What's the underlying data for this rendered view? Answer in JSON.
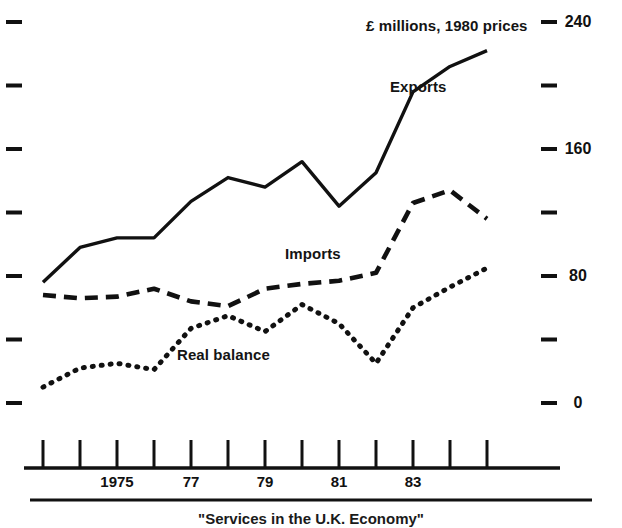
{
  "figure": {
    "units_label": "£ millions, 1980 prices",
    "caption": "\"Services in the U.K. Economy\""
  },
  "series_labels": {
    "exports": "Exports",
    "imports": "Imports",
    "real_balance": "Real balance"
  },
  "y_axis": {
    "labels": [
      "240",
      "160",
      "80",
      "0"
    ],
    "tick_values": [
      240,
      200,
      160,
      120,
      80,
      40,
      0
    ],
    "labeled_values": [
      240,
      160,
      80,
      0
    ],
    "min": 0,
    "max": 240
  },
  "x_axis": {
    "labels": [
      "1975",
      "77",
      "79",
      "81",
      "83"
    ],
    "label_years": [
      1975,
      1977,
      1979,
      1981,
      1983
    ],
    "tick_years": [
      1973,
      1974,
      1975,
      1976,
      1977,
      1978,
      1979,
      1980,
      1981,
      1982,
      1983,
      1984,
      1985
    ],
    "min": 1973,
    "max": 1985
  },
  "chart_data": {
    "type": "line",
    "title": "",
    "subtitle": "",
    "xlabel": "",
    "ylabel": "£ millions, 1980 prices",
    "xlim": [
      1973,
      1985
    ],
    "ylim": [
      0,
      240
    ],
    "grid": false,
    "legend": "inline-annotations",
    "x": [
      1973,
      1974,
      1975,
      1976,
      1977,
      1978,
      1979,
      1980,
      1981,
      1982,
      1983,
      1984,
      1985
    ],
    "series": [
      {
        "name": "Exports",
        "style": "solid",
        "values": [
          76,
          98,
          104,
          104,
          127,
          142,
          136,
          152,
          124,
          145,
          196,
          212,
          222
        ]
      },
      {
        "name": "Imports",
        "style": "dashed",
        "values": [
          68,
          66,
          67,
          72,
          64,
          61,
          72,
          75,
          77,
          82,
          126,
          134,
          116
        ]
      },
      {
        "name": "Real balance",
        "style": "dotted",
        "values": [
          10,
          22,
          25,
          21,
          47,
          55,
          45,
          62,
          50,
          25,
          60,
          73,
          85
        ]
      }
    ]
  },
  "colors": {
    "ink": "#111111",
    "background": "#ffffff"
  }
}
